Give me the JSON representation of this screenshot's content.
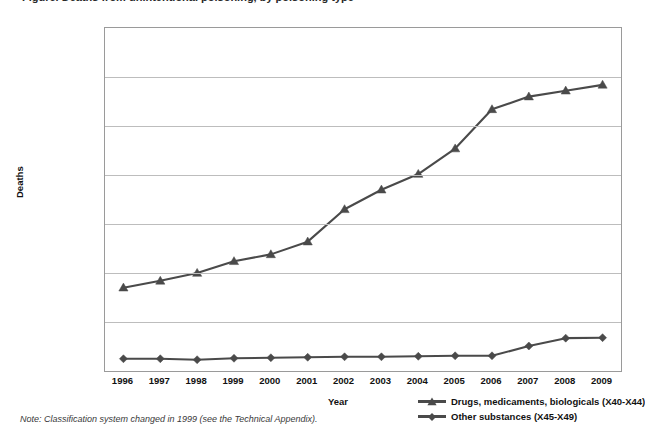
{
  "title": "Figure. Deaths from unintentional poisoning, by poisoning type",
  "note": "Note: Classification system changed in 1999 (see the Technical Appendix).",
  "axes": {
    "y_title": "Deaths",
    "x_title": "Year",
    "y_ticks": [
      "0",
      "5,000",
      "10,000",
      "15,000",
      "20,000",
      "25,000",
      "30,000",
      "35,000"
    ],
    "x_ticks": [
      "1996",
      "1997",
      "1998",
      "1999",
      "2000",
      "2001",
      "2002",
      "2003",
      "2004",
      "2005",
      "2006",
      "2007",
      "2008",
      "2009"
    ]
  },
  "legend": {
    "items": [
      {
        "label": "Drugs, medicaments, biologicals (X40-X44)",
        "marker": "triangle-marker",
        "color": "#4a4a4a"
      },
      {
        "label": "Other substances (X45-X49)",
        "marker": "diamond-marker",
        "color": "#4a4a4a"
      }
    ]
  },
  "colors": {
    "line": "#4a4a4a",
    "grid": "#bdbdbd",
    "frame": "#9a9a9a",
    "text": "#111111"
  },
  "chart_data": {
    "type": "line",
    "title": "Figure. Deaths from unintentional poisoning, by poisoning type",
    "xlabel": "Year",
    "ylabel": "Deaths",
    "x": [
      1996,
      1997,
      1998,
      1999,
      2000,
      2001,
      2002,
      2003,
      2004,
      2005,
      2006,
      2007,
      2008,
      2009
    ],
    "categories": [
      "1996",
      "1997",
      "1998",
      "1999",
      "2000",
      "2001",
      "2002",
      "2003",
      "2004",
      "2005",
      "2006",
      "2007",
      "2008",
      "2009"
    ],
    "ylim": [
      0,
      35000
    ],
    "ytick_step": 5000,
    "grid": true,
    "legend_position": "bottom-right",
    "series": [
      {
        "name": "Drugs, medicaments, biologicals (X40-X44)",
        "marker": "triangle",
        "color": "#4a4a4a",
        "values": [
          8500,
          9200,
          10000,
          11200,
          11900,
          13200,
          16500,
          18500,
          20100,
          22700,
          26700,
          28000,
          28600,
          29200
        ]
      },
      {
        "name": "Other substances (X45-X49)",
        "marker": "diamond",
        "color": "#4a4a4a",
        "values": [
          1250,
          1250,
          1150,
          1300,
          1350,
          1400,
          1450,
          1450,
          1500,
          1550,
          1550,
          2550,
          3350,
          3400
        ]
      }
    ],
    "annotations": [
      "Note: Classification system changed in 1999 (see the Technical Appendix)."
    ]
  }
}
